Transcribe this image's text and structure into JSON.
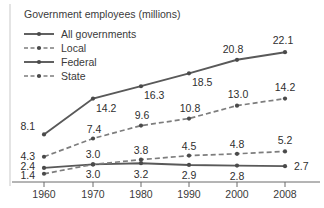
{
  "chart_data": {
    "type": "line",
    "title": "Government employees (millions)",
    "xlabel": "",
    "ylabel": "",
    "categories": [
      "1960",
      "1970",
      "1980",
      "1990",
      "2000",
      "2008"
    ],
    "x": [
      1960,
      1970,
      1980,
      1990,
      2000,
      2008
    ],
    "xlim": [
      1958,
      2010
    ],
    "ylim": [
      0,
      24
    ],
    "grid": false,
    "legend_position": "top-left",
    "series": [
      {
        "name": "All governments",
        "style": "solid",
        "marker": "dot",
        "color": "#595959",
        "values": [
          8.1,
          14.2,
          16.3,
          18.5,
          20.8,
          22.1
        ],
        "labels": [
          "8.1",
          "14.2",
          "16.3",
          "18.5",
          "20.8",
          "22.1"
        ]
      },
      {
        "name": "Local",
        "style": "dashed",
        "marker": "dot",
        "color": "#7d7d7d",
        "values": [
          4.3,
          7.4,
          9.6,
          10.8,
          13.0,
          14.2
        ],
        "labels": [
          "4.3",
          "7.4",
          "9.6",
          "10.8",
          "13.0",
          "14.2"
        ]
      },
      {
        "name": "Federal",
        "style": "solid",
        "marker": "dot",
        "color": "#595959",
        "values": [
          2.4,
          3.0,
          3.2,
          2.9,
          2.8,
          2.7
        ],
        "labels": [
          "2.4",
          "3.0",
          "3.2",
          "2.9",
          "2.8",
          "2.7"
        ]
      },
      {
        "name": "State",
        "style": "dashed",
        "marker": "dot",
        "color": "#7d7d7d",
        "values": [
          1.4,
          3.0,
          3.8,
          4.5,
          4.8,
          5.2
        ],
        "labels": [
          "1.4",
          "3.0",
          "3.8",
          "4.5",
          "4.8",
          "5.2"
        ]
      }
    ],
    "legend": [
      {
        "label": "All governments",
        "style": "solid"
      },
      {
        "label": "Local",
        "style": "dashed"
      },
      {
        "label": "Federal",
        "style": "solid"
      },
      {
        "label": "State",
        "style": "dashed"
      }
    ],
    "colors": {
      "solid_series": "#595959",
      "dashed_series": "#7d7d7d",
      "axis": "#6b6b6b",
      "text": "#3a3a3a",
      "background": "#ffffff"
    }
  }
}
